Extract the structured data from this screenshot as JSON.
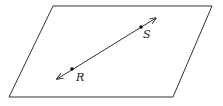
{
  "diagram": {
    "type": "geometry-plane-with-line",
    "plane": {
      "shape": "parallelogram",
      "vertices": [
        [
          53,
          6
        ],
        [
          212,
          6
        ],
        [
          173,
          97
        ],
        [
          9,
          97
        ]
      ],
      "stroke": "#333333"
    },
    "line": {
      "from": [
        57,
        79
      ],
      "to": [
        156,
        18
      ],
      "arrows": "both",
      "stroke": "#333333"
    },
    "points": [
      {
        "label": "R",
        "x": 72,
        "y": 69,
        "label_x": 76,
        "label_y": 81
      },
      {
        "label": "S",
        "x": 141,
        "y": 27,
        "label_x": 143,
        "label_y": 38
      }
    ]
  }
}
